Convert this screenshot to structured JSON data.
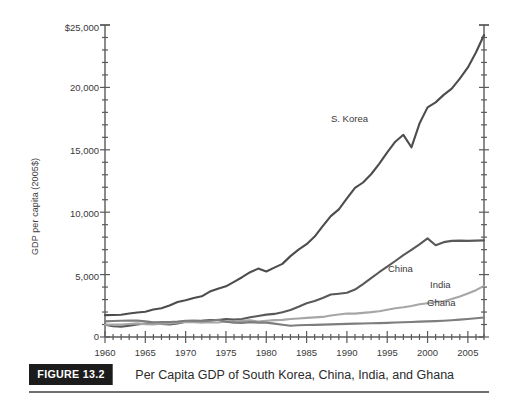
{
  "figure": {
    "tag": "FIGURE 13.2",
    "caption": "Per Capita GDP of South Korea, China, India, and Ghana"
  },
  "axis": {
    "ylabel": "GDP per capita (2005$)",
    "y_ticks": [
      "0",
      "5,000",
      "10,000",
      "15,000",
      "20,000",
      "$25,000"
    ],
    "x_ticks": [
      "1960",
      "1965",
      "1970",
      "1975",
      "1980",
      "1985",
      "1990",
      "1995",
      "2000",
      "2005"
    ]
  },
  "labels": {
    "skorea": "S. Korea",
    "china": "China",
    "india": "India",
    "ghana": "Ghana"
  },
  "colors": {
    "skorea": "#4d4d4d",
    "china": "#595959",
    "india": "#a6a6a6",
    "ghana": "#7d7d7d",
    "axis": "#5a5a5a",
    "caption_box": "#1c1c1c",
    "caption_rule": "#6f6f6f"
  },
  "chart_data": {
    "type": "line",
    "title": "Per Capita GDP of South Korea, China, India, and Ghana",
    "xlabel": "",
    "ylabel": "GDP per capita (2005$)",
    "xlim": [
      1960,
      2007
    ],
    "ylim": [
      0,
      25000
    ],
    "grid": false,
    "legend": "inline-annotations",
    "x": [
      1960,
      1961,
      1962,
      1963,
      1964,
      1965,
      1966,
      1967,
      1968,
      1969,
      1970,
      1971,
      1972,
      1973,
      1974,
      1975,
      1976,
      1977,
      1978,
      1979,
      1980,
      1981,
      1982,
      1983,
      1984,
      1985,
      1986,
      1987,
      1988,
      1989,
      1990,
      1991,
      1992,
      1993,
      1994,
      1995,
      1996,
      1997,
      1998,
      1999,
      2000,
      2001,
      2002,
      2003,
      2004,
      2005,
      2006,
      2007
    ],
    "series": [
      {
        "name": "S. Korea",
        "color": "#4d4d4d",
        "values": [
          1750,
          1760,
          1780,
          1880,
          1960,
          2030,
          2200,
          2310,
          2520,
          2800,
          2950,
          3130,
          3260,
          3640,
          3870,
          4060,
          4420,
          4790,
          5190,
          5480,
          5250,
          5560,
          5860,
          6480,
          7000,
          7440,
          8050,
          8880,
          9690,
          10230,
          11100,
          11950,
          12380,
          13040,
          13880,
          14800,
          15650,
          16200,
          15200,
          17100,
          18400,
          18800,
          19400,
          19900,
          20700,
          21600,
          22800,
          24200
        ]
      },
      {
        "name": "China",
        "color": "#595959",
        "values": [
          990,
          860,
          830,
          900,
          1000,
          1080,
          1130,
          1050,
          1010,
          1090,
          1220,
          1280,
          1290,
          1360,
          1360,
          1430,
          1390,
          1440,
          1580,
          1680,
          1790,
          1850,
          1990,
          2160,
          2420,
          2700,
          2880,
          3130,
          3400,
          3470,
          3550,
          3800,
          4240,
          4710,
          5190,
          5630,
          6090,
          6560,
          6980,
          7420,
          7900,
          7350,
          7600,
          7700,
          7720,
          7700,
          7720,
          7740
        ]
      },
      {
        "name": "India",
        "color": "#a6a6a6",
        "values": [
          980,
          990,
          1000,
          1040,
          1090,
          1030,
          1010,
          1070,
          1090,
          1140,
          1200,
          1180,
          1150,
          1180,
          1160,
          1240,
          1230,
          1290,
          1330,
          1240,
          1300,
          1350,
          1370,
          1440,
          1480,
          1530,
          1570,
          1610,
          1720,
          1800,
          1880,
          1870,
          1930,
          1990,
          2070,
          2180,
          2300,
          2380,
          2490,
          2620,
          2710,
          2820,
          2870,
          3050,
          3250,
          3480,
          3750,
          4100
        ]
      },
      {
        "name": "Ghana",
        "color": "#7d7d7d",
        "values": [
          1250,
          1280,
          1300,
          1310,
          1310,
          1260,
          1180,
          1190,
          1200,
          1230,
          1300,
          1320,
          1290,
          1300,
          1380,
          1220,
          1150,
          1130,
          1190,
          1150,
          1150,
          1070,
          980,
          900,
          940,
          960,
          970,
          990,
          1010,
          1030,
          1050,
          1070,
          1080,
          1100,
          1110,
          1130,
          1160,
          1180,
          1200,
          1230,
          1250,
          1270,
          1300,
          1340,
          1390,
          1440,
          1500,
          1560
        ]
      }
    ]
  }
}
